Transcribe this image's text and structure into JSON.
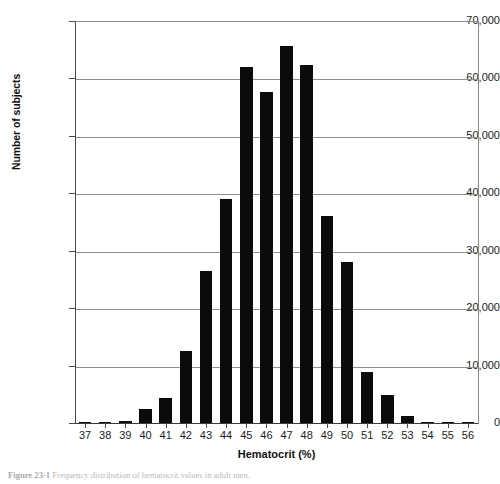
{
  "figure": {
    "caption_label": "Figure 23-1",
    "caption_text": "Frequency distribution of hematocrit values in adult men."
  },
  "chart_data": {
    "type": "bar",
    "title": "",
    "subtitle": "",
    "xlabel": "Hematocrit (%)",
    "ylabel": "Number of subjects",
    "categories": [
      "37",
      "38",
      "39",
      "40",
      "41",
      "42",
      "43",
      "44",
      "45",
      "46",
      "47",
      "48",
      "49",
      "50",
      "51",
      "52",
      "53",
      "54",
      "55",
      "56"
    ],
    "values": [
      200,
      250,
      300,
      2500,
      4400,
      12500,
      26500,
      39000,
      62000,
      57700,
      65600,
      62300,
      36000,
      28100,
      8800,
      4800,
      1300,
      250,
      200,
      100
    ],
    "ylim": [
      0,
      70000
    ],
    "xlim": [
      36.5,
      56.5
    ],
    "y_ticks": [
      0,
      10000,
      20000,
      30000,
      40000,
      50000,
      60000,
      70000
    ],
    "y_tick_labels": [
      "0",
      "10,000",
      "20,000",
      "30,000",
      "40,000",
      "50,000",
      "60,000",
      "70,000"
    ],
    "x_tick_labels": [
      "37",
      "38",
      "39",
      "40",
      "41",
      "42",
      "43",
      "44",
      "45",
      "46",
      "47",
      "48",
      "49",
      "50",
      "51",
      "52",
      "53",
      "54",
      "55",
      "56"
    ],
    "grid": true,
    "grid_axis": "y",
    "legend": null,
    "legend_position": "none",
    "bar_color": "#0b0b0b",
    "gridline_color": "#8e8e8e",
    "axis_color": "#3a3a3a",
    "background_color": "#ffffff"
  }
}
